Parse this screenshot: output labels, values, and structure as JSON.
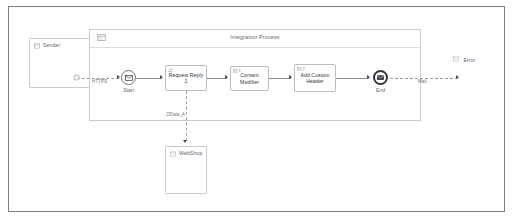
{
  "diagram": {
    "type": "sap-cloud-integration-iflow",
    "pool": {
      "title": "Integration Process",
      "icon": "integration-process-icon"
    },
    "participants": [
      {
        "id": "sender",
        "label": "Sender",
        "icon": "sender-participant-icon"
      },
      {
        "id": "receiver-webshop",
        "label": "WebShop",
        "icon": "receiver-participant-icon"
      },
      {
        "id": "receiver-error",
        "label": "Error",
        "icon": "receiver-participant-icon"
      }
    ],
    "events": [
      {
        "id": "start",
        "label": "Start",
        "icon": "message-start-event-icon"
      },
      {
        "id": "end",
        "label": "End",
        "icon": "message-end-event-icon"
      }
    ],
    "steps": [
      {
        "id": "request-reply-1",
        "label": "Request Reply 1",
        "badge": "",
        "icon": "request-reply-icon"
      },
      {
        "id": "content-modifier",
        "label": "Content Modifier",
        "badge": "1",
        "icon": "content-modifier-icon"
      },
      {
        "id": "add-custom-header",
        "label": "Add Custom\nHeader",
        "label_line1": "Add Custom",
        "label_line2": "Header",
        "badge": "2",
        "icon": "content-modifier-icon"
      }
    ],
    "connections": [
      {
        "id": "sender-to-start",
        "label": "HTTPS",
        "style": "dashed"
      },
      {
        "id": "request-reply-to-webshop",
        "label": "OData_A",
        "style": "dashed"
      },
      {
        "id": "end-to-error",
        "label": "Mail",
        "style": "dashed"
      }
    ],
    "colors": {
      "frame_border": "#7d7f82",
      "canvas_bg": "#ffffff",
      "pool_border": "#c6cdd4",
      "shape_border": "#b6bec6",
      "connector": "#8a9199",
      "text": "#32363a",
      "muted_text": "#5b6670"
    }
  }
}
